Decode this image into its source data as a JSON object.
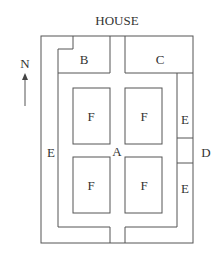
{
  "title": "HOUSE",
  "compass": {
    "label": "N",
    "direction": "north-arrow"
  },
  "areas": {
    "A": "A",
    "B": "B",
    "C": "C",
    "D": "D",
    "E_left": "E",
    "E_right_top": "E",
    "E_right_bottom": "E",
    "F_top_left": "F",
    "F_top_right": "F",
    "F_bottom_left": "F",
    "F_bottom_right": "F"
  },
  "colors": {
    "line": "#555555",
    "text": "#333333",
    "background": "#ffffff"
  }
}
